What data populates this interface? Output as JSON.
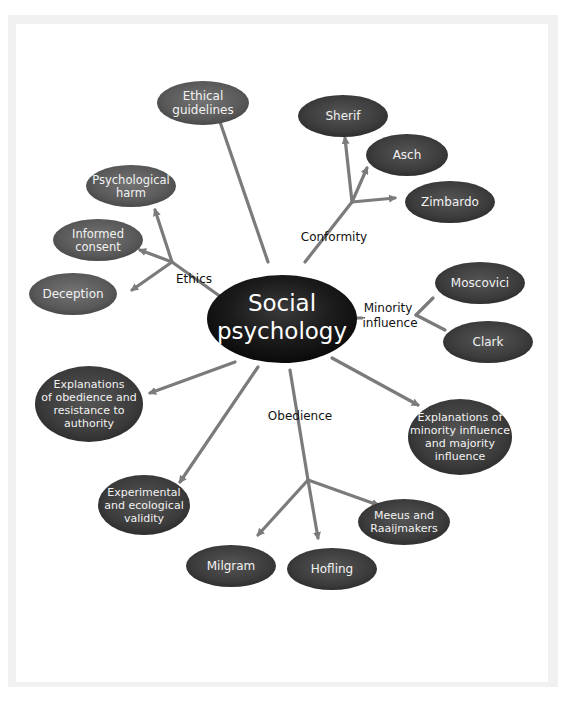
{
  "center": {
    "lines": [
      "Social",
      "psychology"
    ]
  },
  "colors": {
    "node": "#5f5f5f",
    "node_dark": "#3a3a3a",
    "center": "#111111",
    "arrow": "#7b7b7b",
    "frame": "#f1f1f1"
  },
  "branches": {
    "ethics": {
      "label": "Ethics"
    },
    "conformity": {
      "label": "Conformity"
    },
    "minority": {
      "lines": [
        "Minority",
        "influence"
      ]
    },
    "obedience": {
      "label": "Obedience"
    }
  },
  "nodes": {
    "ethical_guidelines": {
      "lines": [
        "Ethical",
        "guidelines"
      ]
    },
    "psychological_harm": {
      "lines": [
        "Psychological",
        "harm"
      ]
    },
    "informed_consent": {
      "lines": [
        "Informed",
        "consent"
      ]
    },
    "deception": {
      "lines": [
        "Deception"
      ]
    },
    "sherif": {
      "lines": [
        "Sherif"
      ]
    },
    "asch": {
      "lines": [
        "Asch"
      ]
    },
    "zimbardo": {
      "lines": [
        "Zimbardo"
      ]
    },
    "moscovici": {
      "lines": [
        "Moscovici"
      ]
    },
    "clark": {
      "lines": [
        "Clark"
      ]
    },
    "explanations_obedience": {
      "lines": [
        "Explanations",
        "of obedience and",
        "resistance to",
        "authority"
      ]
    },
    "explanations_minority": {
      "lines": [
        "Explanations of",
        "minority influence",
        "and majority",
        "influence"
      ]
    },
    "experimental_validity": {
      "lines": [
        "Experimental",
        "and ecological",
        "validity"
      ]
    },
    "milgram": {
      "lines": [
        "Milgram"
      ]
    },
    "hofling": {
      "lines": [
        "Hofling"
      ]
    },
    "meeus": {
      "lines": [
        "Meeus and",
        "Raaijmakers"
      ]
    }
  }
}
